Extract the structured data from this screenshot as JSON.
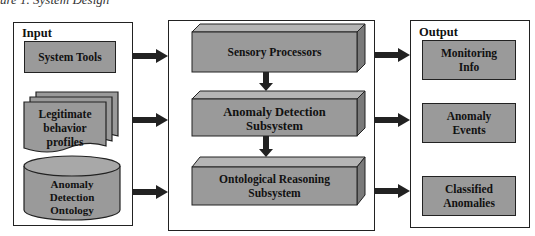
{
  "caption": "ure 1. System Design",
  "input": {
    "title": "Input",
    "items": [
      {
        "label": "System Tools",
        "shape": "rectangle"
      },
      {
        "label": "Legitimate behavior profiles",
        "lines": [
          "Legitimate",
          "behavior",
          "profiles"
        ],
        "shape": "multi-document"
      },
      {
        "label": "Anomaly Detection Ontology",
        "lines": [
          "Anomaly",
          "Detection",
          "Ontology"
        ],
        "shape": "cylinder"
      }
    ]
  },
  "processing": {
    "items": [
      {
        "label": "Sensory Processors",
        "lines": [
          "Sensory Processors"
        ],
        "shape": "3d-box"
      },
      {
        "label": "Anomaly Detection Subsystem",
        "lines": [
          "Anomaly Detection",
          "Subsystem"
        ],
        "shape": "3d-box"
      },
      {
        "label": "Ontological Reasoning Subsystem",
        "lines": [
          "Ontological Reasoning",
          "Subsystem"
        ],
        "shape": "3d-box"
      }
    ]
  },
  "output": {
    "title": "Output",
    "items": [
      {
        "label": "Monitoring Info",
        "lines": [
          "Monitoring",
          "Info"
        ]
      },
      {
        "label": "Anomaly Events",
        "lines": [
          "Anomaly",
          "Events"
        ]
      },
      {
        "label": "Classified Anomalies",
        "lines": [
          "Classified",
          "Anomalies"
        ]
      }
    ]
  },
  "colors": {
    "box_fill": "#9a9a9a",
    "box_top": "#b5b5b5",
    "box_side": "#7a7a7a",
    "stroke": "#222222",
    "arrow": "#222222"
  }
}
